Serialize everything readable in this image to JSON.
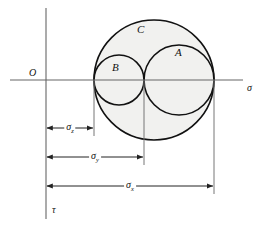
{
  "figure": {
    "type": "mohr-circle-diagram",
    "background_color": "#ffffff",
    "stroke_color": "#111111",
    "axis_color": "#555555",
    "shade_color": "#f0f0ee"
  },
  "axes": {
    "horizontal": {
      "name": "sigma-axis",
      "label": "σ",
      "origin_label": "O"
    },
    "vertical": {
      "name": "tau-axis",
      "label": "τ"
    }
  },
  "circles": [
    {
      "id": "C",
      "label": "C",
      "left": 94,
      "right": 214,
      "center_x": 154,
      "radius": 60
    },
    {
      "id": "A",
      "label": "A",
      "left": 144,
      "right": 214,
      "center_x": 179,
      "radius": 35
    },
    {
      "id": "B",
      "label": "B",
      "left": 94,
      "right": 144,
      "center_x": 119,
      "radius": 25
    }
  ],
  "dimensions": [
    {
      "id": "sigma_z",
      "symbol": "σ",
      "subscript": "z",
      "from": 46,
      "to": 94,
      "y": 128
    },
    {
      "id": "sigma_y",
      "symbol": "σ",
      "subscript": "y",
      "from": 46,
      "to": 144,
      "y": 157
    },
    {
      "id": "sigma_x",
      "symbol": "σ",
      "subscript": "x",
      "from": 46,
      "to": 214,
      "y": 186
    }
  ],
  "labels": {
    "origin": "O",
    "sigma": "σ",
    "tau": "τ",
    "circle_a": "A",
    "circle_b": "B",
    "circle_c": "C",
    "sigma_symbol": "σ",
    "sub_z": "z",
    "sub_y": "y",
    "sub_x": "x"
  }
}
